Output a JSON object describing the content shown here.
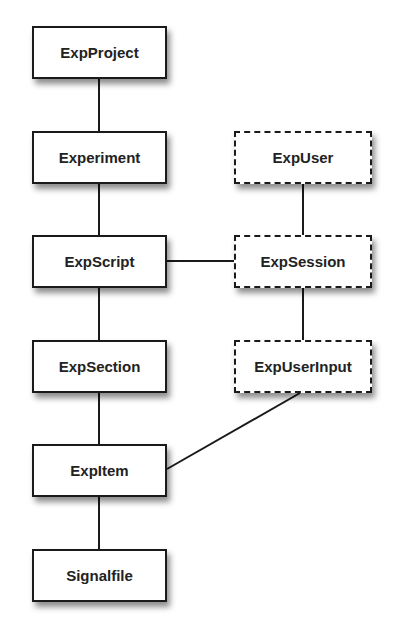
{
  "diagram": {
    "title": "",
    "nodes": [
      {
        "id": "expproject",
        "label": "ExpProject",
        "style": "solid",
        "x": 32,
        "y": 26,
        "w": 135,
        "h": 53
      },
      {
        "id": "experiment",
        "label": "Experiment",
        "style": "solid",
        "x": 32,
        "y": 131,
        "w": 135,
        "h": 53
      },
      {
        "id": "expscript",
        "label": "ExpScript",
        "style": "solid",
        "x": 32,
        "y": 235,
        "w": 135,
        "h": 53
      },
      {
        "id": "expsection",
        "label": "ExpSection",
        "style": "solid",
        "x": 32,
        "y": 340,
        "w": 135,
        "h": 53
      },
      {
        "id": "expitem",
        "label": "ExpItem",
        "style": "solid",
        "x": 32,
        "y": 444,
        "w": 135,
        "h": 53
      },
      {
        "id": "signalfile",
        "label": "Signalfile",
        "style": "solid",
        "x": 32,
        "y": 549,
        "w": 135,
        "h": 53
      },
      {
        "id": "expuser",
        "label": "ExpUser",
        "style": "dashed",
        "x": 234,
        "y": 131,
        "w": 138,
        "h": 53
      },
      {
        "id": "expsession",
        "label": "ExpSession",
        "style": "dashed",
        "x": 234,
        "y": 235,
        "w": 138,
        "h": 53
      },
      {
        "id": "expuserinput",
        "label": "ExpUserInput",
        "style": "dashed",
        "x": 234,
        "y": 340,
        "w": 138,
        "h": 53
      }
    ],
    "edges": [
      {
        "from": "expproject",
        "to": "experiment"
      },
      {
        "from": "experiment",
        "to": "expscript"
      },
      {
        "from": "expscript",
        "to": "expsection"
      },
      {
        "from": "expsection",
        "to": "expitem"
      },
      {
        "from": "expitem",
        "to": "signalfile"
      },
      {
        "from": "expuser",
        "to": "expsession"
      },
      {
        "from": "expsession",
        "to": "expuserinput"
      },
      {
        "from": "expscript",
        "to": "expsession"
      },
      {
        "from": "expuserinput",
        "to": "expitem"
      }
    ],
    "colors": {
      "stroke": "#1a1a1a",
      "fill": "#ffffff",
      "text": "#222222"
    }
  }
}
